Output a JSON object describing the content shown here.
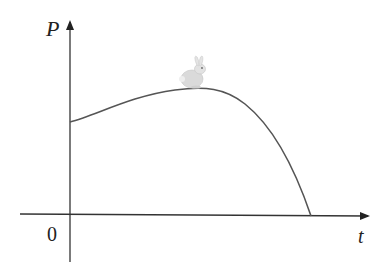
{
  "diagram": {
    "axes": {
      "y_label": "P",
      "x_label": "t",
      "origin_label": "0"
    },
    "curve": {
      "description": "Population P over time t: starts positive, rises to a maximum, then declines to zero",
      "stroke_color": "#555555"
    },
    "icon": "rabbit-icon",
    "colors": {
      "axis": "#333333",
      "curve": "#555555",
      "rabbit": "#d8d8d8"
    }
  }
}
